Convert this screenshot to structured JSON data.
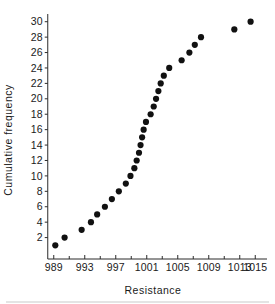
{
  "chart_data": {
    "type": "scatter",
    "title": "",
    "xlabel": "Resistance",
    "ylabel": "Cumulative frequency",
    "xlim": [
      988,
      1016
    ],
    "ylim": [
      0,
      31
    ],
    "grid": false,
    "legend": null,
    "x_ticks_major": [
      989,
      993,
      997,
      1001,
      1005,
      1009,
      1013,
      1015
    ],
    "x_tick_labels": [
      "989",
      "993",
      "997",
      "1001",
      "1005",
      "1009",
      "1013",
      "1015"
    ],
    "x_ticks_minor": [
      991,
      995,
      999,
      1003,
      1007,
      1011
    ],
    "y_ticks": [
      2,
      4,
      6,
      8,
      10,
      12,
      14,
      16,
      18,
      20,
      22,
      24,
      26,
      28,
      30
    ],
    "y_tick_labels": [
      "2",
      "4",
      "6",
      "8",
      "10",
      "12",
      "14",
      "16",
      "18",
      "20",
      "22",
      "24",
      "26",
      "28",
      "30"
    ],
    "marker": "filled-circle",
    "marker_color": "#111111",
    "marker_size": 3.1,
    "x": [
      989.2,
      990.4,
      992.6,
      993.8,
      994.6,
      995.6,
      996.5,
      997.4,
      998.3,
      998.9,
      999.4,
      999.7,
      1000.0,
      1000.2,
      1000.4,
      1000.6,
      1000.9,
      1001.5,
      1001.9,
      1002.2,
      1002.5,
      1002.8,
      1003.2,
      1003.9,
      1005.5,
      1006.5,
      1007.2,
      1008.0,
      1012.3,
      1014.4
    ],
    "y": [
      1,
      2,
      3,
      4,
      5,
      6,
      7,
      8,
      9,
      10,
      11,
      12,
      13,
      14,
      15,
      16,
      17,
      18,
      19,
      20,
      21,
      22,
      23,
      24,
      25,
      26,
      27,
      28,
      29,
      30
    ],
    "points": [
      {
        "x": 989.2,
        "y": 1
      },
      {
        "x": 990.4,
        "y": 2
      },
      {
        "x": 992.6,
        "y": 3
      },
      {
        "x": 993.8,
        "y": 4
      },
      {
        "x": 994.6,
        "y": 5
      },
      {
        "x": 995.6,
        "y": 6
      },
      {
        "x": 996.5,
        "y": 7
      },
      {
        "x": 997.4,
        "y": 8
      },
      {
        "x": 998.3,
        "y": 9
      },
      {
        "x": 998.9,
        "y": 10
      },
      {
        "x": 999.4,
        "y": 11
      },
      {
        "x": 999.7,
        "y": 12
      },
      {
        "x": 1000.0,
        "y": 13
      },
      {
        "x": 1000.2,
        "y": 14
      },
      {
        "x": 1000.4,
        "y": 15
      },
      {
        "x": 1000.6,
        "y": 16
      },
      {
        "x": 1000.9,
        "y": 17
      },
      {
        "x": 1001.5,
        "y": 18
      },
      {
        "x": 1001.9,
        "y": 19
      },
      {
        "x": 1002.2,
        "y": 20
      },
      {
        "x": 1002.5,
        "y": 21
      },
      {
        "x": 1002.8,
        "y": 22
      },
      {
        "x": 1003.2,
        "y": 23
      },
      {
        "x": 1003.9,
        "y": 24
      },
      {
        "x": 1005.5,
        "y": 25
      },
      {
        "x": 1006.5,
        "y": 26
      },
      {
        "x": 1007.2,
        "y": 27
      },
      {
        "x": 1008.0,
        "y": 28
      },
      {
        "x": 1012.3,
        "y": 29
      },
      {
        "x": 1014.4,
        "y": 30
      }
    ]
  }
}
